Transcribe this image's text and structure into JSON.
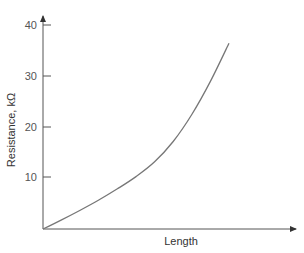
{
  "chart_data": {
    "type": "line",
    "title": "",
    "xlabel": "Length",
    "ylabel": "Resistance, kΩ",
    "ylim": [
      0,
      40
    ],
    "yticks": [
      10,
      20,
      30,
      40
    ],
    "xticks": [],
    "grid": false,
    "legend": null,
    "series": [
      {
        "name": "Resistance vs Length",
        "x": [
          0,
          0.1,
          0.2,
          0.3,
          0.4,
          0.5,
          0.6,
          0.7,
          0.8,
          0.9,
          1.0
        ],
        "values": [
          0,
          1.8,
          3.7,
          5.7,
          7.9,
          10.3,
          13.2,
          17.2,
          22.5,
          29.0,
          36.5
        ]
      }
    ]
  },
  "labels": {
    "xlabel": "Length",
    "ylabel": "Resistance, kΩ",
    "ytick_10": "10",
    "ytick_20": "20",
    "ytick_30": "30",
    "ytick_40": "40"
  }
}
